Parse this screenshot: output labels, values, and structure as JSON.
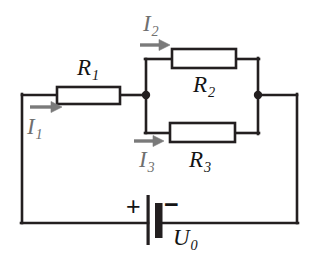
{
  "diagram": {
    "type": "electrical-circuit-schematic",
    "colors": {
      "wire": "#231f20",
      "resistor_outline": "#231f20",
      "resistor_fill": "#ffffff",
      "node_dot": "#231f20",
      "current_arrow": "#7a7a7a",
      "label_text": "#141414",
      "current_label_text": "#6f6f6f",
      "background": "#ffffff"
    },
    "components": {
      "resistor_1": {
        "label": "R",
        "subscript": "1"
      },
      "resistor_2": {
        "label": "R",
        "subscript": "2"
      },
      "resistor_3": {
        "label": "R",
        "subscript": "3"
      },
      "source": {
        "label": "U",
        "subscript": "0",
        "plus": "+",
        "minus": "−"
      }
    },
    "currents": {
      "current_1": {
        "label": "I",
        "subscript": "1",
        "direction": "right"
      },
      "current_2": {
        "label": "I",
        "subscript": "2",
        "direction": "right"
      },
      "current_3": {
        "label": "I",
        "subscript": "3",
        "direction": "right"
      }
    },
    "nodes": {
      "left_junction": "node-a",
      "right_junction": "node-b"
    }
  }
}
